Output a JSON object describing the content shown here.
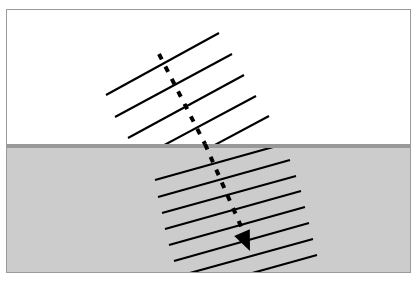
{
  "figure": {
    "frame": {
      "x": 6,
      "y": 9,
      "width": 405,
      "height": 264,
      "border_color": "#9a9a9a",
      "border_width": 1
    },
    "media": [
      {
        "name": "upper-medium",
        "label": "less dense medium",
        "fill": "#ffffff",
        "region_top": 0,
        "region_height": 134
      },
      {
        "name": "lower-medium",
        "label": "denser medium",
        "fill": "#cccccc",
        "region_top": 138,
        "region_height": 124
      }
    ],
    "boundary": {
      "name": "medium-boundary",
      "color": "#999999",
      "y": 134,
      "thickness": 4,
      "x_start": 0,
      "x_end": 403
    },
    "incident_wavefronts": {
      "count": 5,
      "stroke": "#000000",
      "stroke_width": 2.1,
      "angle_deg": 28.5,
      "spacing_px": 27,
      "lines": [
        {
          "x1": 99,
          "y1": 85,
          "x2": 212,
          "y2": 23
        },
        {
          "x1": 108,
          "y1": 107,
          "x2": 225,
          "y2": 44
        },
        {
          "x1": 121,
          "y1": 128,
          "x2": 237,
          "y2": 65
        },
        {
          "x1": 133,
          "y1": 148,
          "x2": 249,
          "y2": 86
        },
        {
          "x1": 146,
          "y1": 168,
          "x2": 262,
          "y2": 106
        }
      ]
    },
    "refracted_wavefronts": {
      "count": 8,
      "stroke": "#000000",
      "stroke_width": 2.1,
      "angle_deg": 15.5,
      "spacing_px": 16,
      "lines": [
        {
          "x1": 148,
          "y1": 170,
          "x2": 277,
          "y2": 134
        },
        {
          "x1": 151,
          "y1": 187,
          "x2": 283,
          "y2": 150
        },
        {
          "x1": 155,
          "y1": 203,
          "x2": 289,
          "y2": 166
        },
        {
          "x1": 158,
          "y1": 219,
          "x2": 294,
          "y2": 181
        },
        {
          "x1": 162,
          "y1": 235,
          "x2": 298,
          "y2": 197
        },
        {
          "x1": 167,
          "y1": 251,
          "x2": 302,
          "y2": 213
        },
        {
          "x1": 172,
          "y1": 266,
          "x2": 306,
          "y2": 229
        },
        {
          "x1": 177,
          "y1": 282,
          "x2": 310,
          "y2": 245
        }
      ]
    },
    "ray": {
      "name": "wave-direction-ray",
      "style": "dashed",
      "stroke": "#000000",
      "stroke_width": 4,
      "dash_pattern": "6 8",
      "incident_segment": {
        "x1": 152,
        "y1": 44,
        "x2": 198,
        "y2": 134
      },
      "refracted_segment": {
        "x1": 198,
        "y1": 134,
        "x2": 240,
        "y2": 230
      },
      "incident_angle_from_normal_deg": 27,
      "refracted_angle_from_normal_deg": 24,
      "arrowhead": {
        "name": "ray-arrowhead",
        "tip_x": 243,
        "tip_y": 241,
        "width": 17,
        "length": 20
      }
    }
  }
}
